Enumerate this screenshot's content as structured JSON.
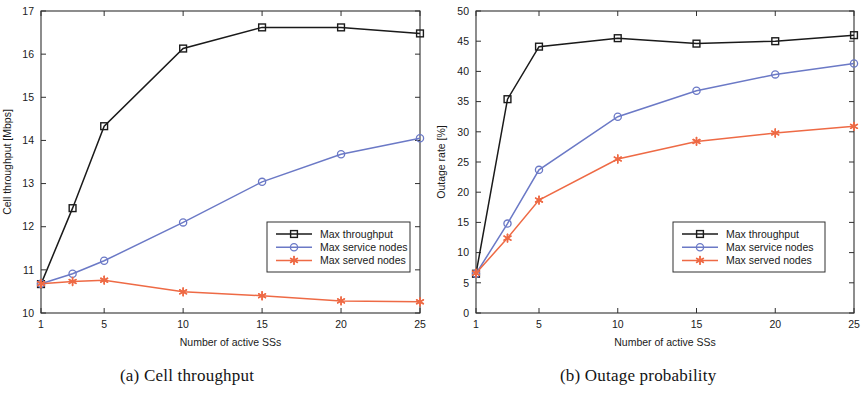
{
  "figure": {
    "caption_a": "(a) Cell throughput",
    "caption_b": "(b) Outage probability"
  },
  "colors": {
    "max_throughput": "#1a1a1a",
    "max_service_nodes": "#6b79c6",
    "max_served_nodes": "#ee6a45",
    "axis": "#303030",
    "background": "#ffffff"
  },
  "legend": {
    "entries": [
      {
        "label": "Max throughput",
        "color": "#1a1a1a",
        "marker": "square"
      },
      {
        "label": "Max service nodes",
        "color": "#6b79c6",
        "marker": "circle"
      },
      {
        "label": "Max served nodes",
        "color": "#ee6a45",
        "marker": "star"
      }
    ]
  },
  "chart_data": [
    {
      "type": "line",
      "title": "(a) Cell throughput",
      "xlabel": "Number of active SSs",
      "ylabel": "Cell throughput [Mbps]",
      "x": [
        1,
        3,
        5,
        10,
        15,
        20,
        25
      ],
      "xlim": [
        1,
        25
      ],
      "ylim": [
        10,
        17
      ],
      "xticks": [
        1,
        5,
        10,
        15,
        20,
        25
      ],
      "yticks": [
        10,
        11,
        12,
        13,
        14,
        15,
        16,
        17
      ],
      "grid": false,
      "legend_position": "lower right",
      "series": [
        {
          "name": "Max throughput",
          "color": "#1a1a1a",
          "marker": "square",
          "values": [
            10.67,
            12.43,
            14.33,
            16.13,
            16.62,
            16.62,
            16.48
          ]
        },
        {
          "name": "Max service nodes",
          "color": "#6b79c6",
          "marker": "circle",
          "values": [
            10.68,
            10.91,
            11.21,
            12.1,
            13.04,
            13.68,
            14.05
          ]
        },
        {
          "name": "Max served nodes",
          "color": "#ee6a45",
          "marker": "star",
          "values": [
            10.68,
            10.73,
            10.76,
            10.49,
            10.4,
            10.28,
            10.26
          ]
        }
      ]
    },
    {
      "type": "line",
      "title": "(b) Outage probability",
      "xlabel": "Number of active SSs",
      "ylabel": "Outage rate [%]",
      "x": [
        1,
        3,
        5,
        10,
        15,
        20,
        25
      ],
      "xlim": [
        1,
        25
      ],
      "ylim": [
        0,
        50
      ],
      "xticks": [
        1,
        5,
        10,
        15,
        20,
        25
      ],
      "yticks": [
        0,
        5,
        10,
        15,
        20,
        25,
        30,
        35,
        40,
        45,
        50
      ],
      "grid": false,
      "legend_position": "lower right",
      "series": [
        {
          "name": "Max throughput",
          "color": "#1a1a1a",
          "marker": "square",
          "values": [
            6.5,
            35.4,
            44.1,
            45.5,
            44.6,
            45.0,
            46.0
          ]
        },
        {
          "name": "Max service nodes",
          "color": "#6b79c6",
          "marker": "circle",
          "values": [
            6.5,
            14.8,
            23.7,
            32.5,
            36.8,
            39.5,
            41.3
          ]
        },
        {
          "name": "Max served nodes",
          "color": "#ee6a45",
          "marker": "star",
          "values": [
            6.6,
            12.4,
            18.7,
            25.5,
            28.4,
            29.8,
            30.9
          ]
        }
      ]
    }
  ]
}
